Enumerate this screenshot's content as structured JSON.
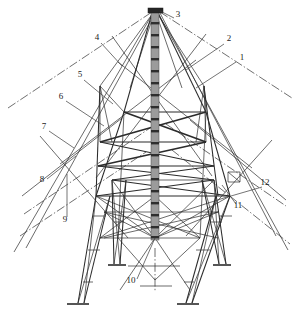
{
  "figure": {
    "kind": "technical-line-drawing",
    "background_color": "#ffffff",
    "line_color": "#2b2b2b",
    "mast_fill_color": "#9b9b9b",
    "mast_rung_color": "#2e2e2e",
    "width_px": 299,
    "height_px": 316
  },
  "callouts": [
    {
      "id": "1",
      "label": "1",
      "x": 242,
      "y": 60,
      "leader": {
        "x1": 236,
        "y1": 62,
        "x2": 196,
        "y2": 88
      }
    },
    {
      "id": "2",
      "label": "2",
      "x": 229,
      "y": 41,
      "leader": {
        "x1": 224,
        "y1": 44,
        "x2": 186,
        "y2": 70
      }
    },
    {
      "id": "3",
      "label": "3",
      "x": 178,
      "y": 17,
      "leader": {
        "x1": 174,
        "y1": 18,
        "x2": 160,
        "y2": 11
      }
    },
    {
      "id": "4",
      "label": "4",
      "x": 97,
      "y": 40,
      "leader": {
        "x1": 101,
        "y1": 43,
        "x2": 122,
        "y2": 66
      }
    },
    {
      "id": "5",
      "label": "5",
      "x": 80,
      "y": 77,
      "leader": {
        "x1": 84,
        "y1": 80,
        "x2": 113,
        "y2": 104
      }
    },
    {
      "id": "6",
      "label": "6",
      "x": 61,
      "y": 99,
      "leader": {
        "x1": 66,
        "y1": 101,
        "x2": 104,
        "y2": 126
      }
    },
    {
      "id": "7",
      "label": "7",
      "x": 44,
      "y": 129,
      "leader": {
        "x1": 49,
        "y1": 131,
        "x2": 74,
        "y2": 148
      }
    },
    {
      "id": "8",
      "label": "8",
      "x": 42,
      "y": 182,
      "leader": {
        "x1": 47,
        "y1": 179,
        "x2": 76,
        "y2": 156
      }
    },
    {
      "id": "9",
      "label": "9",
      "x": 65,
      "y": 222,
      "leader": {
        "x1": 67,
        "y1": 217,
        "x2": 67,
        "y2": 174
      }
    },
    {
      "id": "10",
      "label": "10",
      "x": 131,
      "y": 283,
      "leader": {
        "x1": 137,
        "y1": 279,
        "x2": 155,
        "y2": 238
      }
    },
    {
      "id": "11",
      "label": "11",
      "x": 238,
      "y": 208,
      "leader": {
        "x1": 236,
        "y1": 204,
        "x2": 222,
        "y2": 185
      }
    },
    {
      "id": "12",
      "label": "12",
      "x": 265,
      "y": 185,
      "leader": {
        "x1": 262,
        "y1": 187,
        "x2": 231,
        "y2": 196
      }
    }
  ],
  "mast": {
    "name": "central vertical mast column",
    "x_center": 155,
    "top_y": 10,
    "bottom_y": 240,
    "half_width": 4,
    "cap": {
      "x": 148,
      "y": 8,
      "w": 15,
      "h": 5
    },
    "rungs_y": [
      22,
      34,
      46,
      58,
      70,
      82,
      94,
      106,
      118,
      130,
      142,
      154,
      166,
      178,
      190,
      202,
      214,
      226,
      236
    ]
  },
  "base_plates": [
    {
      "name": "front-left-base-plate",
      "x": 78,
      "y": 305,
      "w": 22
    },
    {
      "name": "front-right-base-plate",
      "x": 188,
      "y": 305,
      "w": 22
    },
    {
      "name": "rear-left-base-plate",
      "x": 117,
      "y": 266,
      "w": 18
    },
    {
      "name": "rear-right-base-plate",
      "x": 222,
      "y": 266,
      "w": 18
    }
  ],
  "guy_lines": [
    {
      "name": "guy-upper-left",
      "x1": 8,
      "y1": 108,
      "x2": 152,
      "y2": 12
    },
    {
      "name": "guy-upper-right",
      "x1": 160,
      "y1": 12,
      "x2": 292,
      "y2": 98
    },
    {
      "name": "guy-mid-left",
      "x1": 24,
      "y1": 214,
      "x2": 150,
      "y2": 128
    },
    {
      "name": "guy-mid-right",
      "x1": 166,
      "y1": 124,
      "x2": 286,
      "y2": 206
    },
    {
      "name": "guy-low-left",
      "x1": 20,
      "y1": 236,
      "x2": 146,
      "y2": 152
    },
    {
      "name": "guy-low-right",
      "x1": 172,
      "y1": 150,
      "x2": 290,
      "y2": 244
    }
  ]
}
